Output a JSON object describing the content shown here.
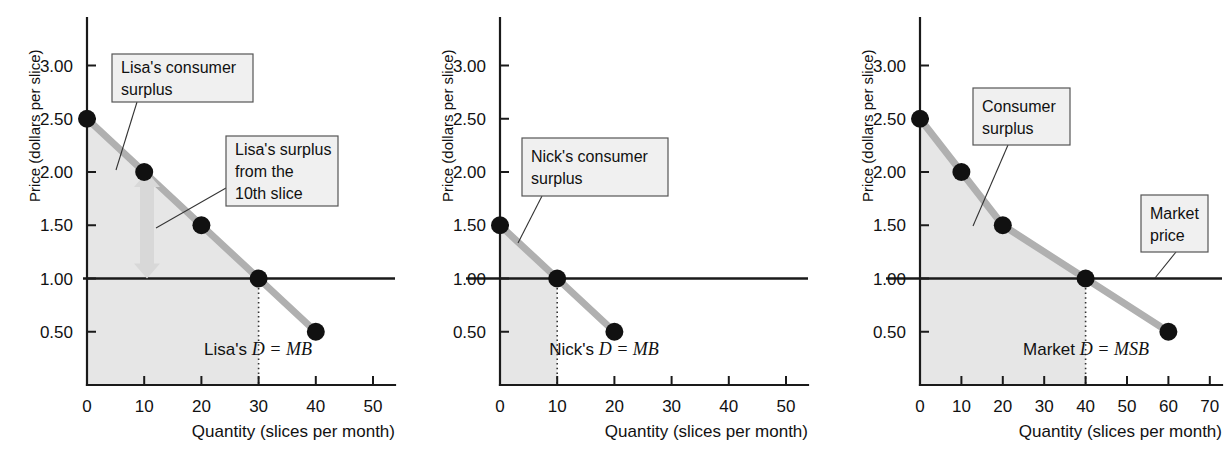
{
  "figure": {
    "axis_y_label": "Price (dollars per slice)",
    "axis_x_label": "Quantity (slices per month)"
  },
  "chart_data": [
    {
      "type": "line",
      "panel_id": "lisa",
      "title": "",
      "xlabel": "Quantity (slices per month)",
      "ylabel": "Price (dollars per slice)",
      "xlim": [
        0,
        55
      ],
      "ylim": [
        0,
        3.25
      ],
      "grid": false,
      "xticks": [
        0,
        10,
        20,
        30,
        40,
        50
      ],
      "xtick_labels": [
        "0",
        "10",
        "20",
        "30",
        "40",
        "50"
      ],
      "yticks": [
        0.5,
        1.0,
        1.5,
        2.0,
        2.5,
        3.0
      ],
      "ytick_labels": [
        "0.50",
        "1.00",
        "1.50",
        "2.00",
        "2.50",
        "3.00"
      ],
      "series": [
        {
          "name": "Lisa's D = MB",
          "x": [
            0,
            10,
            20,
            30,
            40
          ],
          "values": [
            2.5,
            2.0,
            1.5,
            1.0,
            0.5
          ]
        }
      ],
      "markers": [
        {
          "x": 0,
          "y": 2.5
        },
        {
          "x": 10,
          "y": 2.0
        },
        {
          "x": 20,
          "y": 1.5
        },
        {
          "x": 30,
          "y": 1.0
        },
        {
          "x": 40,
          "y": 0.5
        }
      ],
      "market_price": 1.0,
      "equilibrium_quantity": 30,
      "curve_label": "Lisa's ",
      "curve_label_italic": "D = MB",
      "surplus_polygon": [
        [
          0,
          2.5
        ],
        [
          30,
          1.0
        ],
        [
          30,
          0.0
        ],
        [
          0,
          0.0
        ]
      ],
      "annotations": [
        {
          "id": "lisa-consumer-surplus",
          "lines": [
            "Lisa's consumer",
            "surplus"
          ],
          "box": {
            "x": 112,
            "y": 54,
            "w": 141,
            "h": 48
          },
          "leader": [
            [
              137,
              102
            ],
            [
              116,
              170
            ]
          ]
        },
        {
          "id": "lisa-surplus-10th-slice",
          "lines": [
            "Lisa's surplus",
            "from the",
            "10th slice"
          ],
          "box": {
            "x": 226,
            "y": 136,
            "w": 112,
            "h": 70
          },
          "leader": [
            [
              226,
              188
            ],
            [
              156,
              228
            ]
          ]
        }
      ],
      "double_arrow": {
        "x": 147,
        "y_top": 2.0,
        "y_bottom": 1.0
      }
    },
    {
      "type": "line",
      "panel_id": "nick",
      "title": "",
      "xlabel": "Quantity (slices per month)",
      "ylabel": "Price (dollars per slice)",
      "xlim": [
        0,
        55
      ],
      "ylim": [
        0,
        3.25
      ],
      "grid": false,
      "xticks": [
        0,
        10,
        20,
        30,
        40,
        50
      ],
      "xtick_labels": [
        "0",
        "10",
        "20",
        "30",
        "40",
        "50"
      ],
      "yticks": [
        0.5,
        1.0,
        1.5,
        2.0,
        2.5,
        3.0
      ],
      "ytick_labels": [
        "0.50",
        "1.00",
        "1.50",
        "2.00",
        "2.50",
        "3.00"
      ],
      "series": [
        {
          "name": "Nick's D = MB",
          "x": [
            0,
            10,
            20
          ],
          "values": [
            1.5,
            1.0,
            0.5
          ]
        }
      ],
      "markers": [
        {
          "x": 0,
          "y": 1.5
        },
        {
          "x": 10,
          "y": 1.0
        },
        {
          "x": 20,
          "y": 0.5
        }
      ],
      "market_price": 1.0,
      "equilibrium_quantity": 10,
      "curve_label": "Nick's ",
      "curve_label_italic": "D = MB",
      "surplus_polygon": [
        [
          0,
          1.5
        ],
        [
          10,
          1.0
        ],
        [
          10,
          0.0
        ],
        [
          0,
          0.0
        ]
      ],
      "annotations": [
        {
          "id": "nick-consumer-surplus",
          "lines": [
            "Nick's consumer",
            "surplus"
          ],
          "box": {
            "x": 522,
            "y": 138,
            "w": 146,
            "h": 58
          },
          "leader": [
            [
              542,
              196
            ],
            [
              518,
              243
            ]
          ]
        }
      ],
      "double_arrow": null
    },
    {
      "type": "line",
      "panel_id": "market",
      "title": "",
      "xlabel": "Quantity (slices per month)",
      "ylabel": "Price (dollars per slice)",
      "xlim": [
        0,
        76
      ],
      "ylim": [
        0,
        3.25
      ],
      "grid": false,
      "xticks": [
        0,
        10,
        20,
        30,
        40,
        50,
        60,
        70
      ],
      "xtick_labels": [
        "0",
        "10",
        "20",
        "30",
        "40",
        "50",
        "60",
        "70"
      ],
      "yticks": [
        0.5,
        1.0,
        1.5,
        2.0,
        2.5,
        3.0
      ],
      "ytick_labels": [
        "0.50",
        "1.00",
        "1.50",
        "2.00",
        "2.50",
        "3.00"
      ],
      "series": [
        {
          "name": "Market D = MSB",
          "x": [
            0,
            10,
            20,
            40,
            60
          ],
          "values": [
            2.5,
            2.0,
            1.5,
            1.0,
            0.5
          ]
        }
      ],
      "markers": [
        {
          "x": 0,
          "y": 2.5
        },
        {
          "x": 10,
          "y": 2.0
        },
        {
          "x": 20,
          "y": 1.5
        },
        {
          "x": 40,
          "y": 1.0
        },
        {
          "x": 60,
          "y": 0.5
        }
      ],
      "market_price": 1.0,
      "equilibrium_quantity": 40,
      "curve_label": "Market ",
      "curve_label_italic": "D = MSB",
      "surplus_polygon": [
        [
          0,
          2.5
        ],
        [
          10,
          2.0
        ],
        [
          20,
          1.5
        ],
        [
          40,
          1.0
        ],
        [
          40,
          0.0
        ],
        [
          0,
          0.0
        ]
      ],
      "annotations": [
        {
          "id": "market-consumer-surplus",
          "lines": [
            "Consumer",
            "surplus"
          ],
          "box": {
            "x": 973,
            "y": 88,
            "w": 97,
            "h": 57
          },
          "leader": [
            [
              1008,
              145
            ],
            [
              973,
              226
            ]
          ]
        },
        {
          "id": "market-price-callout",
          "lines": [
            "Market",
            "price"
          ],
          "box": {
            "x": 1141,
            "y": 195,
            "w": 67,
            "h": 57
          },
          "leader": [
            [
              1176,
              252
            ],
            [
              1155,
              278
            ]
          ]
        }
      ],
      "double_arrow": null
    }
  ],
  "panels": [
    {
      "id": "lisa",
      "origin_x": 87,
      "origin_y": 385,
      "px_per_unit_x": 5.72,
      "axis_top_y": 18,
      "axis_right_x": 395,
      "curve_label_x": 258,
      "curve_label_y": 355
    },
    {
      "id": "nick",
      "origin_x": 500,
      "origin_y": 385,
      "px_per_unit_x": 5.72,
      "axis_top_y": 18,
      "axis_right_x": 808,
      "curve_label_x": 604,
      "curve_label_y": 355
    },
    {
      "id": "market",
      "origin_x": 920,
      "origin_y": 385,
      "px_per_unit_x": 4.14,
      "axis_top_y": 18,
      "axis_right_x": 1222,
      "curve_label_x": 1086,
      "curve_label_y": 355
    }
  ]
}
